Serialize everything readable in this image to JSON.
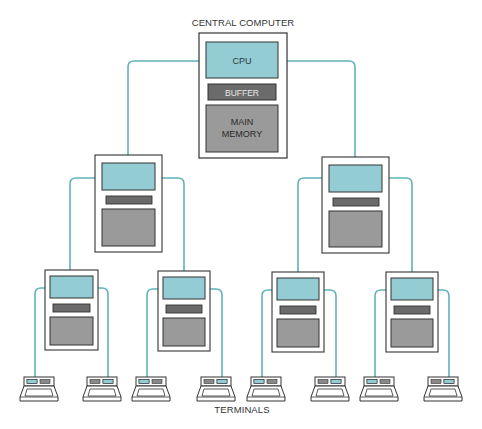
{
  "diagram": {
    "title": "CENTRAL COMPUTER",
    "footer": "TERMINALS",
    "colors": {
      "link": "#5fb3b8",
      "cpu_fill": "#93cdd3",
      "buffer_fill": "#6b6b6b",
      "memory_fill": "#9a9a9a",
      "box_stroke": "#333333",
      "background": "#ffffff"
    },
    "central": {
      "cpu_label": "CPU",
      "buffer_label": "BUFFER",
      "memory_label_line1": "MAIN",
      "memory_label_line2": "MEMORY"
    },
    "levels": [
      {
        "name": "central-computer",
        "count": 1
      },
      {
        "name": "regional-computers",
        "count": 2
      },
      {
        "name": "local-computers",
        "count": 4
      },
      {
        "name": "terminals",
        "count": 8
      }
    ]
  }
}
